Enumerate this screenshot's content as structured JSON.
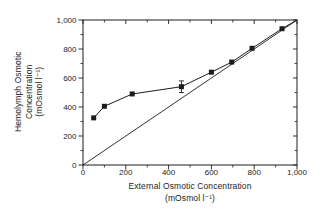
{
  "figure": {
    "background": "#ffffff",
    "ink_color": "#1c1c1c"
  },
  "chart_data": {
    "type": "scatter",
    "title": "",
    "xlabel_line1": "External Osmotic Concentration",
    "xlabel_line2": "(mOsmol l⁻¹)",
    "ylabel_line1": "Hemolymph Osmotic",
    "ylabel_line2": "Concentration",
    "ylabel_line3": "(mOsmol l⁻¹)",
    "xlim": [
      0,
      1000
    ],
    "ylim": [
      0,
      1000
    ],
    "x_major_ticks": [
      0,
      200,
      400,
      600,
      800,
      1000
    ],
    "x_tick_labels": [
      "0",
      "200",
      "400",
      "600",
      "800",
      "1,000"
    ],
    "y_major_ticks": [
      0,
      200,
      400,
      600,
      800,
      1000
    ],
    "y_tick_labels": [
      "0",
      "200",
      "400",
      "600",
      "800",
      "1,000"
    ],
    "minor_ticks_x": [
      100,
      300,
      500,
      700,
      900
    ],
    "minor_ticks_y": [
      100,
      300,
      500,
      700,
      900
    ],
    "grid": false,
    "legend": "none",
    "series": [
      {
        "name": "hemolymph-osmotic-concentration",
        "marker": "filled-square",
        "x": [
          50,
          100,
          230,
          460,
          600,
          695,
          790,
          930
        ],
        "y": [
          325,
          405,
          490,
          540,
          640,
          710,
          805,
          940
        ],
        "y_error": [
          0,
          0,
          0,
          40,
          0,
          0,
          0,
          0
        ],
        "line_end": [
          1000,
          1000
        ]
      }
    ],
    "reference_line": {
      "name": "isosmotic-line",
      "from": [
        0,
        0
      ],
      "to": [
        1000,
        1000
      ]
    }
  }
}
